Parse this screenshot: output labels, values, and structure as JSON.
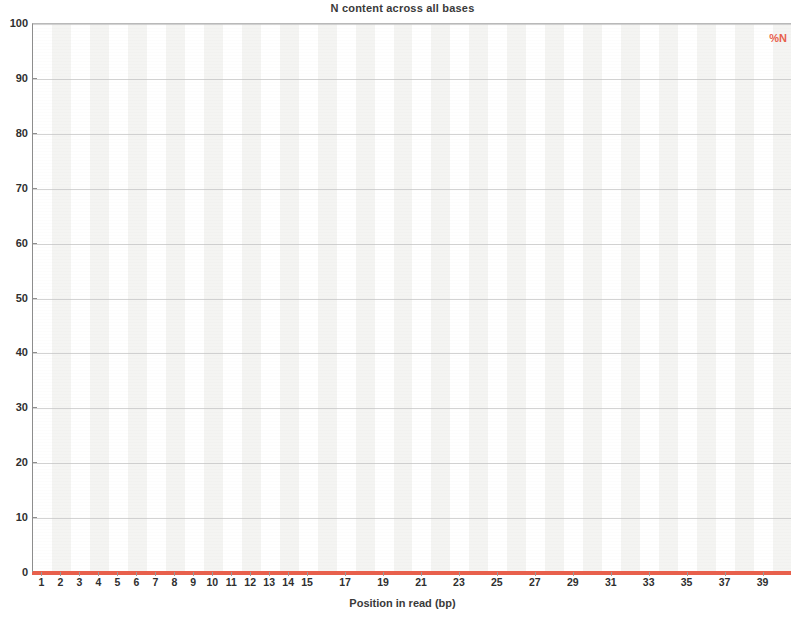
{
  "chart_data": {
    "type": "line",
    "title": "N content across all bases",
    "xlabel": "Position in read (bp)",
    "ylabel": "",
    "xlim": [
      1,
      40
    ],
    "ylim": [
      0,
      100
    ],
    "grid": true,
    "legend_position": "top-right",
    "legend": [
      "%N"
    ],
    "series": [
      {
        "name": "%N",
        "color": "#e8604c",
        "x": [
          1,
          2,
          3,
          4,
          5,
          6,
          7,
          8,
          9,
          10,
          11,
          12,
          13,
          14,
          15,
          16,
          17,
          18,
          19,
          20,
          21,
          22,
          23,
          24,
          25,
          26,
          27,
          28,
          29,
          30,
          31,
          32,
          33,
          34,
          35,
          36,
          37,
          38,
          39,
          40
        ],
        "values": [
          0,
          0,
          0,
          0,
          0,
          0,
          0,
          0,
          0,
          0,
          0,
          0,
          0,
          0,
          0,
          0,
          0,
          0,
          0,
          0,
          0,
          0,
          0,
          0,
          0,
          0,
          0,
          0,
          0,
          0,
          0,
          0,
          0,
          0,
          0,
          0,
          0,
          0,
          0,
          0
        ]
      }
    ],
    "y_ticks": [
      0,
      10,
      20,
      30,
      40,
      50,
      60,
      70,
      80,
      90,
      100
    ],
    "y_tick_labels": [
      "0",
      "10",
      "20",
      "30",
      "40",
      "50",
      "60",
      "70",
      "80",
      "90",
      "100"
    ],
    "x_ticks": [
      1,
      2,
      3,
      4,
      5,
      6,
      7,
      8,
      9,
      10,
      11,
      12,
      13,
      14,
      15,
      17,
      19,
      21,
      23,
      25,
      27,
      29,
      31,
      33,
      35,
      37,
      39
    ],
    "x_tick_labels": [
      "1",
      "2",
      "3",
      "4",
      "5",
      "6",
      "7",
      "8",
      "9",
      "10",
      "11",
      "12",
      "13",
      "14",
      "15",
      "17",
      "19",
      "21",
      "23",
      "25",
      "27",
      "29",
      "31",
      "33",
      "35",
      "37",
      "39"
    ],
    "background_banding": true,
    "accent_color": "#e8604c",
    "grid_color": "#c4c4c4",
    "band_color": "#f4f4f2"
  }
}
